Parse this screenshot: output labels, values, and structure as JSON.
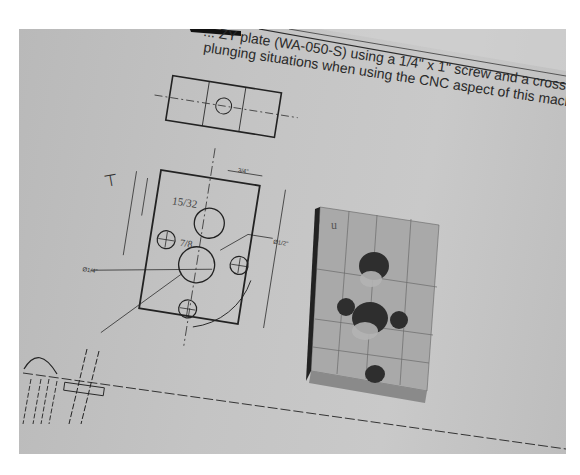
{
  "image": {
    "description": "Photograph of a printed technical drawing with a machined wooden block resting on it",
    "colors": {
      "paper": "#c4c4c4",
      "ink": "#222222",
      "wood": "#a8a8a8",
      "hole": "#2e2e2e",
      "border": "#ffffff"
    }
  },
  "document": {
    "caption_line_1": "... ZY plate (WA-050-S) using a 1/4\" x 1\" screw and a cross",
    "caption_line_2": "plunging situations when using the CNC aspect of this machine."
  },
  "drawing": {
    "handwritten_mark_top": "T",
    "handwritten_fraction_1": "15/32",
    "handwritten_fraction_2": "7/8",
    "dimensions": [
      "3/4\"",
      "1 1/8\"",
      "1 3/4\"",
      "Ø1/2\"",
      "Ø1/4\"",
      "3 1/8\"",
      "1/2\"",
      "45°"
    ]
  },
  "block": {
    "handwritten_mark": "U",
    "holes": 5
  }
}
